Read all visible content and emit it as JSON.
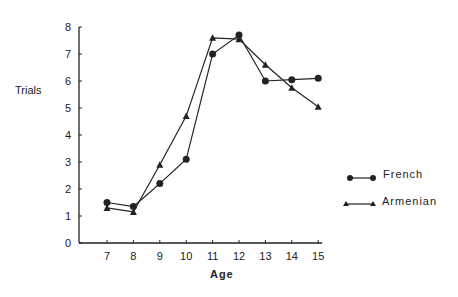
{
  "chart_data": {
    "type": "line",
    "title": "",
    "xlabel": "Age",
    "ylabel": "Trials",
    "x": [
      7,
      8,
      9,
      10,
      11,
      12,
      13,
      14,
      15
    ],
    "xlim": [
      6,
      15
    ],
    "ylim": [
      0,
      8
    ],
    "yticks": [
      0,
      1,
      2,
      3,
      4,
      5,
      6,
      7,
      8
    ],
    "grid": false,
    "legend_position": "right",
    "series": [
      {
        "name": "French",
        "marker": "circle",
        "values": [
          1.5,
          1.35,
          2.2,
          3.1,
          7.0,
          7.7,
          6.0,
          6.05,
          6.1
        ]
      },
      {
        "name": "Armenian",
        "marker": "triangle",
        "values": [
          1.3,
          1.15,
          2.9,
          4.7,
          7.6,
          7.55,
          6.6,
          5.75,
          5.05
        ]
      }
    ]
  },
  "labels": {
    "ylabel": "Trials",
    "xlabel": "Age",
    "legend_french": "French",
    "legend_armenian": "Armenian"
  }
}
